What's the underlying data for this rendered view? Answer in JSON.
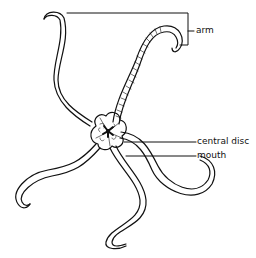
{
  "diagram": {
    "labels": {
      "arm": "arm",
      "central_disc": "central disc",
      "mouth": "mouth"
    },
    "colors": {
      "line": "#111111",
      "background": "#ffffff"
    }
  }
}
